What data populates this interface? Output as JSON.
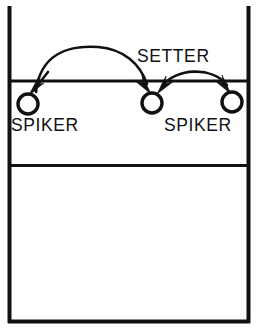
{
  "diagram": {
    "type": "volleyball-court-play-diagram",
    "colors": {
      "line": "#111111",
      "background": "#ffffff",
      "arrow": "#111111"
    },
    "court": {
      "name": "volleyball-court",
      "left_sideline_x": 8,
      "right_sideline_x": 250,
      "top_y": 8,
      "bottom_y": 323,
      "net_line_y": 81,
      "attack_line_y": 165,
      "border_width": 4,
      "net_line_width": 3,
      "attack_line_width": 3,
      "top_edge_open": true
    },
    "players": [
      {
        "id": "left-spiker",
        "label": "SPIKER",
        "cx": 28,
        "cy": 104,
        "r": 10,
        "label_x": 10,
        "label_y": 130
      },
      {
        "id": "setter",
        "label": "SETTER",
        "cx": 152,
        "cy": 103,
        "r": 10,
        "label_x": 137,
        "label_y": 62
      },
      {
        "id": "right-spiker",
        "label": "SPIKER",
        "cx": 232,
        "cy": 102,
        "r": 10,
        "label_x": 164,
        "label_y": 130
      }
    ],
    "movements": [
      {
        "id": "long-arc-to-setter",
        "from": "left-spiker",
        "to": "setter",
        "direction": "rightward",
        "path": "M 34 92 C 44 47, 120 40, 146 86",
        "arrow_tip_x": 148,
        "arrow_tip_y": 92,
        "arrow_angle_deg": 62
      },
      {
        "id": "short-arc-setter-to-right",
        "from": "setter",
        "to": "right-spiker",
        "direction": "rightward",
        "path": "M 164 86 C 180 66, 212 66, 228 86",
        "arrow_tip_x": 230,
        "arrow_tip_y": 92,
        "arrow_angle_deg": 58
      },
      {
        "id": "short-arc-return-to-setter",
        "from": "right-spiker",
        "to": "setter",
        "direction": "leftward",
        "arrow_tip_x": 160,
        "arrow_tip_y": 90,
        "arrow_angle_deg": 208
      },
      {
        "id": "left-spiker-entry-arrow",
        "from": "net",
        "to": "left-spiker",
        "direction": "downward-left",
        "path": "M 46 74 L 32 92",
        "arrow_tip_x": 30,
        "arrow_tip_y": 94,
        "arrow_angle_deg": 128
      }
    ],
    "labels": {
      "setter": "SETTER",
      "left_spiker": "SPIKER",
      "right_spiker": "SPIKER"
    }
  }
}
